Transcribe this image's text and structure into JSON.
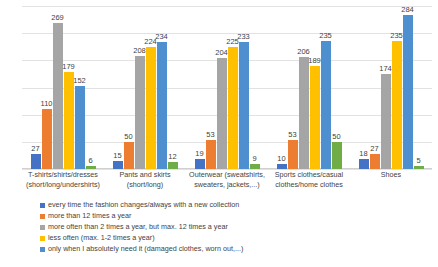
{
  "chart_data": {
    "type": "bar",
    "title": "",
    "subtitle": "",
    "xlabel": "",
    "ylabel": "",
    "ylim": [
      0,
      300
    ],
    "grid": true,
    "gridline_values": [
      0,
      50,
      100,
      150,
      200,
      250,
      300
    ],
    "legend_position": "bottom-left",
    "categories": [
      "T-shirts/shirts/dresses (short/long/undershirts)",
      "Pants and skirts (short/long)",
      "Outerwear (sweatshirts, sweaters, jackets,...)",
      "Sports clothes/casual clothes/home clothes",
      "Shoes"
    ],
    "category_lines": [
      [
        "T-shirts/shirts/dresses",
        "(short/long/undershirts)"
      ],
      [
        "Pants and skirts",
        "(short/long)"
      ],
      [
        "Outerwear (sweatshirts,",
        "sweaters, jackets,...)"
      ],
      [
        "Sports clothes/casual",
        "clothes/home clothes"
      ],
      [
        "Shoes"
      ]
    ],
    "series": [
      {
        "name": "every time the fashion changes/always with a new collection",
        "color": "#4472C4",
        "values": [
          27,
          15,
          19,
          10,
          18
        ]
      },
      {
        "name": "more than 12 times a year",
        "color": "#ED7D31",
        "values": [
          110,
          50,
          53,
          53,
          27
        ]
      },
      {
        "name": "more often than 2 times a year, but max. 12 times a year",
        "color": "#A5A5A5",
        "values": [
          269,
          208,
          204,
          206,
          174
        ]
      },
      {
        "name": "less often (max. 1-2 times a year)",
        "color": "#FFC000",
        "values": [
          179,
          224,
          225,
          189,
          235
        ]
      },
      {
        "name": "only when I absolutely need it (damaged clothes, worn out,...)",
        "color": "#4E8FD0",
        "values": [
          152,
          234,
          233,
          235,
          284
        ]
      },
      {
        "name": "",
        "color": "#70AD47",
        "values": [
          6,
          12,
          9,
          50,
          5
        ]
      }
    ]
  },
  "legend": {
    "items": [
      {
        "label": "every time the fashion changes/always with a new collection",
        "color": "#4472C4"
      },
      {
        "label": "more than 12 times a year",
        "color": "#ED7D31"
      },
      {
        "label": "more often than 2 times a year, but max. 12 times a year",
        "color": "#A5A5A5"
      },
      {
        "label": "less often (max. 1-2 times a year)",
        "color": "#FFC000"
      },
      {
        "label": "only when I absolutely need it (damaged clothes, worn out,...)",
        "color": "#4E8FD0"
      }
    ]
  }
}
